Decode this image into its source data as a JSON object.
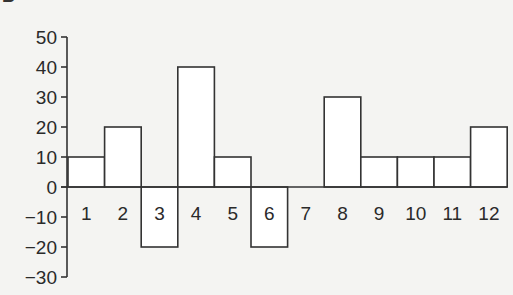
{
  "panel_letter": "B",
  "chart_data": {
    "type": "bar",
    "title": "",
    "xlabel": "",
    "ylabel": "",
    "categories": [
      "1",
      "2",
      "3",
      "4",
      "5",
      "6",
      "7",
      "8",
      "9",
      "10",
      "11",
      "12"
    ],
    "values": [
      10,
      20,
      -20,
      40,
      10,
      -20,
      0,
      30,
      10,
      10,
      10,
      20
    ],
    "ylim": [
      -30,
      50
    ],
    "yticks": [
      50,
      40,
      30,
      20,
      10,
      0,
      -10,
      -20,
      -30
    ],
    "ytick_labels": [
      "50",
      "40",
      "30",
      "20",
      "10",
      "0",
      "−10",
      "−20",
      "−30"
    ],
    "grid": false,
    "legend": null,
    "bar_fill": "#ffffff",
    "bar_stroke": "#333333",
    "category_labels_position": "below zero line"
  }
}
